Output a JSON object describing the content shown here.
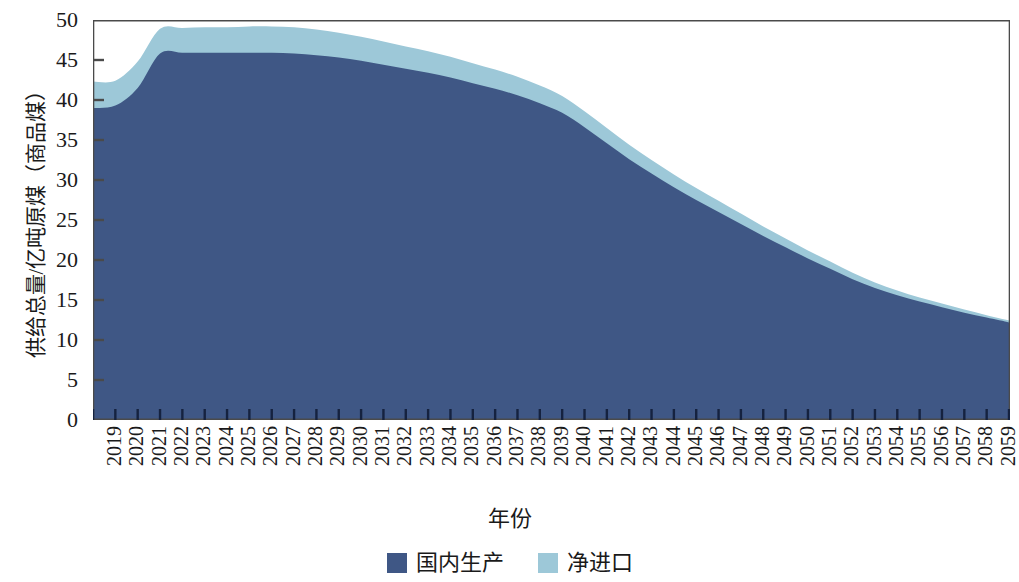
{
  "chart_data": {
    "type": "area",
    "stacked": true,
    "title": "",
    "xlabel": "年份",
    "ylabel": "供给总量/亿吨原煤（商品煤）",
    "ylim": [
      0,
      50
    ],
    "yticks": [
      0,
      5,
      10,
      15,
      20,
      25,
      30,
      35,
      40,
      45,
      50
    ],
    "grid": false,
    "legend_position": "bottom",
    "x": [
      2019,
      2020,
      2021,
      2022,
      2023,
      2024,
      2025,
      2026,
      2027,
      2028,
      2029,
      2030,
      2031,
      2032,
      2033,
      2034,
      2035,
      2036,
      2037,
      2038,
      2039,
      2040,
      2041,
      2042,
      2043,
      2044,
      2045,
      2046,
      2047,
      2048,
      2049,
      2050,
      2051,
      2052,
      2053,
      2054,
      2055,
      2056,
      2057,
      2058,
      2059,
      2060
    ],
    "series": [
      {
        "name": "国内生产",
        "color": "#3F5785",
        "values": [
          39.0,
          39.3,
          41.5,
          45.8,
          45.9,
          45.9,
          45.9,
          45.9,
          45.9,
          45.8,
          45.6,
          45.3,
          44.9,
          44.4,
          43.9,
          43.4,
          42.8,
          42.1,
          41.4,
          40.6,
          39.6,
          38.4,
          36.6,
          34.6,
          32.6,
          30.8,
          29.1,
          27.5,
          26.0,
          24.5,
          23.0,
          21.6,
          20.2,
          18.9,
          17.6,
          16.5,
          15.6,
          14.8,
          14.1,
          13.4,
          12.8,
          12.2
        ]
      },
      {
        "name": "净进口",
        "color": "#9DC8D8",
        "values": [
          3.3,
          3.1,
          3.3,
          3.1,
          3.1,
          3.2,
          3.2,
          3.3,
          3.3,
          3.3,
          3.2,
          3.1,
          3.0,
          2.9,
          2.8,
          2.7,
          2.6,
          2.5,
          2.4,
          2.3,
          2.2,
          2.1,
          2.0,
          1.9,
          1.8,
          1.7,
          1.6,
          1.5,
          1.4,
          1.3,
          1.2,
          1.1,
          1.0,
          0.9,
          0.8,
          0.7,
          0.6,
          0.5,
          0.45,
          0.4,
          0.3,
          0.25
        ]
      }
    ],
    "totals": [
      42.3,
      42.4,
      44.8,
      48.9,
      49.0,
      49.1,
      49.1,
      49.2,
      49.2,
      49.1,
      48.8,
      48.4,
      47.9,
      47.3,
      46.7,
      46.1,
      45.4,
      44.6,
      43.8,
      42.9,
      41.8,
      40.5,
      38.6,
      36.5,
      34.4,
      32.5,
      30.7,
      29.0,
      27.4,
      25.8,
      24.2,
      22.7,
      21.2,
      19.8,
      18.4,
      17.2,
      16.2,
      15.3,
      14.55,
      13.8,
      13.1,
      12.45
    ]
  },
  "axes": {
    "y_title": "供给总量/亿吨原煤（商品煤）",
    "x_title": "年份",
    "y_tick_labels": [
      "50",
      "45",
      "40",
      "35",
      "30",
      "25",
      "20",
      "15",
      "10",
      "5",
      "0"
    ],
    "x_tick_labels": [
      "2019",
      "2020",
      "2021",
      "2022",
      "2023",
      "2024",
      "2025",
      "2026",
      "2027",
      "2028",
      "2029",
      "2030",
      "2031",
      "2032",
      "2033",
      "2034",
      "2035",
      "2036",
      "2037",
      "2038",
      "2039",
      "2040",
      "2041",
      "2042",
      "2043",
      "2044",
      "2045",
      "2046",
      "2047",
      "2048",
      "2049",
      "2050",
      "2051",
      "2052",
      "2053",
      "2054",
      "2055",
      "2056",
      "2057",
      "2058",
      "2059",
      "2060"
    ]
  },
  "legend": {
    "items": [
      {
        "label": "国内生产",
        "color": "#3F5785"
      },
      {
        "label": "净进口",
        "color": "#9DC8D8"
      }
    ]
  },
  "colors": {
    "domestic": "#3F5785",
    "imports": "#9DC8D8",
    "axis": "#4a4a4a",
    "text": "#1a1a1a",
    "background": "#ffffff"
  }
}
